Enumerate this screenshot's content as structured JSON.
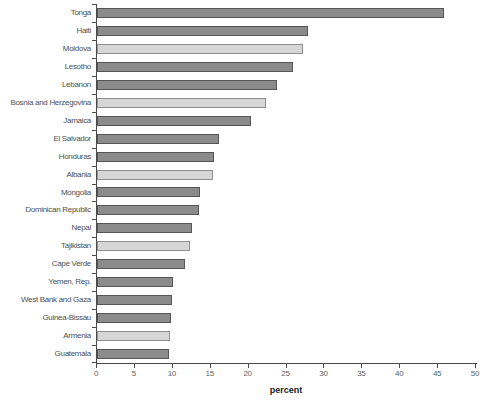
{
  "chart_data": {
    "type": "bar",
    "orientation": "horizontal",
    "title": "",
    "xlabel": "percent",
    "xlim": [
      0,
      50
    ],
    "xticks": [
      0,
      5,
      10,
      15,
      20,
      25,
      30,
      35,
      40,
      45,
      50
    ],
    "grid": false,
    "legend": false,
    "categories": [
      "Tonga",
      "Haiti",
      "Moldova",
      "Lesotho",
      "Lebanon",
      "Bosnia and Herzegovina",
      "Jamaica",
      "El Salvador",
      "Honduras",
      "Albania",
      "Mongolia",
      "Dominican Republic",
      "Nepal",
      "Tajikistan",
      "Cape Verde",
      "Yemen, Rep.",
      "West Bank and Gaza",
      "Guinea-Bissau",
      "Armenia",
      "Guatemala"
    ],
    "values": [
      45.8,
      27.8,
      27.2,
      25.9,
      23.7,
      22.3,
      20.3,
      16.1,
      15.4,
      15.3,
      13.6,
      13.4,
      12.5,
      12.3,
      11.6,
      10.0,
      9.9,
      9.8,
      9.6,
      9.5
    ],
    "bar_shades": [
      "dark",
      "dark",
      "light",
      "dark",
      "dark",
      "light",
      "dark",
      "dark",
      "dark",
      "light",
      "dark",
      "dark",
      "dark",
      "light",
      "dark",
      "dark",
      "dark",
      "dark",
      "light",
      "dark"
    ],
    "colors": {
      "bar_dark_fill": "#8b8b8b",
      "bar_dark_border": "#565656",
      "bar_light_fill": "#d6d6d6",
      "bar_light_border": "#8f8f8f",
      "axis_line": "#4a4a4a",
      "tick_label": "#5f5f5f",
      "category_label": "#4f4f4f",
      "xlabel_color": "#1a1a1a",
      "background": "#ffffff"
    }
  }
}
